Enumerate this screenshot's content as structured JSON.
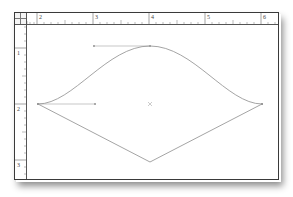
{
  "rulers": {
    "horizontal": {
      "labels": [
        "2",
        "3",
        "4",
        "5",
        "6"
      ]
    },
    "vertical": {
      "labels": [
        "1",
        "2",
        "3"
      ]
    }
  },
  "canvas": {
    "path_stroke": "#9a9a9a",
    "handle_stroke": "#b0b0b0",
    "shape": "bezier-curve-with-v-bottom",
    "center_marker": "x"
  }
}
